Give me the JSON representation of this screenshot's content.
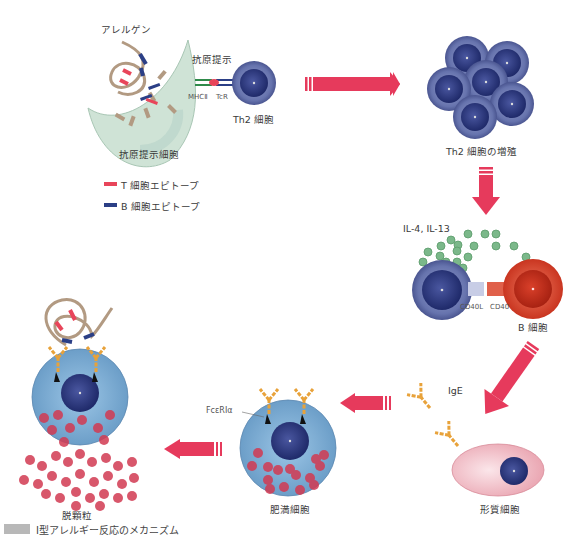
{
  "labels": {
    "allergen": "アレルゲン",
    "antigen_presentation": "抗原提示",
    "mhc2": "MHCⅡ",
    "tcr": "TcR",
    "th2_cell": "Th2 細胞",
    "apc": "抗原提示細胞",
    "th2_proliferation": "Th2 細胞の増殖",
    "il": "IL-4,  IL-13",
    "cd40l": "CD40L",
    "cd40": "CD40",
    "b_cell": "B 細胞",
    "ige": "IgE",
    "plasma_cell": "形質細胞",
    "fcer": "FcεRⅠα",
    "mast_cell": "肥満細胞",
    "degranulation": "脱顆粒"
  },
  "legend": [
    {
      "label": "T 細胞エピトープ",
      "color": "#e8455a"
    },
    {
      "label": "B 細胞エピトープ",
      "color": "#2b3f86"
    }
  ],
  "caption": {
    "text": "Ⅰ型アレルギー反応のメカニズム"
  },
  "colors": {
    "arrow": "#e63a5c",
    "th2": "#5b6aa8",
    "nucleus": "#2a3478",
    "bcell": "#d8402e",
    "mast": "#7fb0d8",
    "granule": "#d23a52",
    "ige": "#e8a23a",
    "cytokine": "#6aa87a",
    "apc": "#cfe3d6"
  }
}
